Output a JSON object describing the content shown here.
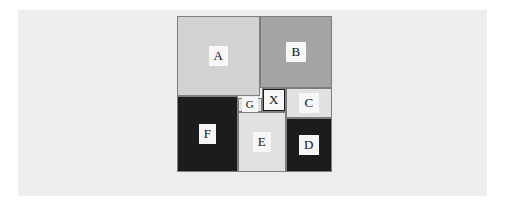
{
  "figure": {
    "name": "squared-square-dissection",
    "background_color": "#ffffff",
    "panel_color": "#eceded",
    "outline_color": "#7d7d7d",
    "label_background": "#f7f7f7",
    "label_color": "#111111",
    "canvas": {
      "width": 507,
      "height": 210
    },
    "panel": {
      "x": 18,
      "y": 10,
      "width": 469,
      "height": 186
    },
    "square": {
      "x": 177,
      "y": 16,
      "width": 155,
      "height": 156
    },
    "pieces": [
      {
        "id": "A",
        "label": "A",
        "x": 0,
        "y": 0,
        "width": 83,
        "height": 80,
        "fill": "#d2d2d2"
      },
      {
        "id": "B",
        "label": "B",
        "x": 83,
        "y": 0,
        "width": 72,
        "height": 72,
        "fill": "#a5a5a5"
      },
      {
        "id": "C",
        "label": "C",
        "x": 109,
        "y": 72,
        "width": 46,
        "height": 30,
        "fill": "#e1e1e1"
      },
      {
        "id": "X",
        "label": "X",
        "x": 85,
        "y": 72,
        "width": 24,
        "height": 24,
        "fill": "#1c1c1c"
      },
      {
        "id": "G",
        "label": "G",
        "x": 61,
        "y": 82,
        "width": 24,
        "height": 14,
        "fill": "#e1e1e1"
      },
      {
        "id": "F",
        "label": "F",
        "x": 0,
        "y": 80,
        "width": 61,
        "height": 76,
        "fill": "#1c1c1c"
      },
      {
        "id": "E",
        "label": "E",
        "x": 61,
        "y": 96,
        "width": 48,
        "height": 60,
        "fill": "#e1e1e1"
      },
      {
        "id": "D",
        "label": "D",
        "x": 109,
        "y": 102,
        "width": 46,
        "height": 54,
        "fill": "#1c1c1c"
      }
    ]
  }
}
